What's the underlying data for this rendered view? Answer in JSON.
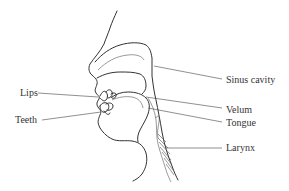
{
  "diagram": {
    "type": "anatomical cross-section of the human vocal tract",
    "labels": {
      "lips": "Lips",
      "teeth": "Teeth",
      "sinus_cavity": "Sinus cavity",
      "velum": "Velum",
      "tongue": "Tongue",
      "larynx": "Larynx"
    }
  }
}
